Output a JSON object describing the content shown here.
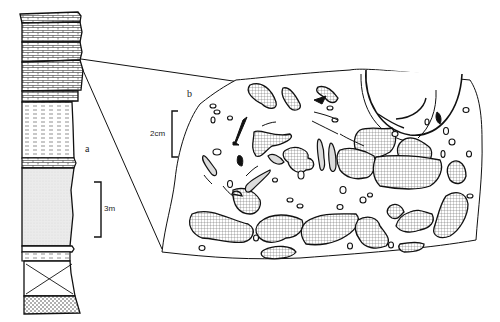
{
  "figure": {
    "panels": [
      {
        "id": "a",
        "label": "a",
        "description": "Stratigraphic column"
      },
      {
        "id": "b",
        "label": "b",
        "description": "Enlarged section showing clasts and fossil fragments"
      }
    ],
    "scale_bars": {
      "column": "3m",
      "detail": "2cm"
    },
    "column_units_top_to_bottom": [
      "limestone bed",
      "limestone bed",
      "limestone bed",
      "limestone bed",
      "shale / marl (dashed)",
      "stippled sandstone/mudstone",
      "thin shale band",
      "cross-marked unit (covered)",
      "dotted sandstone"
    ]
  },
  "colors": {
    "line": "#111111",
    "fill_stipple": "#e4e4e4",
    "background": "#ffffff"
  }
}
